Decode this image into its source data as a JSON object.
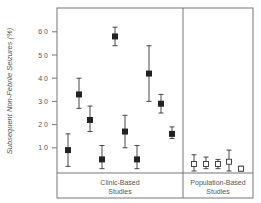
{
  "chart_data": {
    "type": "scatter",
    "title": "",
    "ylabel": "Subsequent Non-Febrile Seizures (%)",
    "xlabel": "",
    "ylim": [
      0,
      70
    ],
    "yticks": [
      10,
      20,
      30,
      40,
      50,
      60
    ],
    "ytick_labels": [
      "1 0",
      "2 0",
      "3 0",
      "4 0",
      "5 0",
      "6 0"
    ],
    "grid": false,
    "groups": [
      {
        "name": "Clinic-Based Studies",
        "label_lines": [
          "Clinic-Based",
          "Studies"
        ],
        "marker": "filled-square",
        "points": [
          {
            "value": 9,
            "low": 2,
            "high": 16
          },
          {
            "value": 33,
            "low": 27,
            "high": 40
          },
          {
            "value": 22,
            "low": 17,
            "high": 28
          },
          {
            "value": 5,
            "low": 1,
            "high": 11
          },
          {
            "value": 58,
            "low": 54,
            "high": 62
          },
          {
            "value": 17,
            "low": 10,
            "high": 24
          },
          {
            "value": 5,
            "low": 1,
            "high": 11
          },
          {
            "value": 42,
            "low": 30,
            "high": 54
          },
          {
            "value": 29,
            "low": 25,
            "high": 33
          },
          {
            "value": 16,
            "low": 14,
            "high": 19
          }
        ]
      },
      {
        "name": "Population-Based Studies",
        "label_lines": [
          "Population-Based",
          "Studies"
        ],
        "marker": "open-square",
        "points": [
          {
            "value": 3,
            "low": 0,
            "high": 7
          },
          {
            "value": 3,
            "low": 1,
            "high": 6
          },
          {
            "value": 3,
            "low": 1,
            "high": 5
          },
          {
            "value": 4,
            "low": 0,
            "high": 9
          },
          {
            "value": 1,
            "low": 0,
            "high": 2
          }
        ]
      }
    ]
  },
  "colors": {
    "frame": "#777777",
    "marker": "#222222",
    "text": "#555555"
  }
}
